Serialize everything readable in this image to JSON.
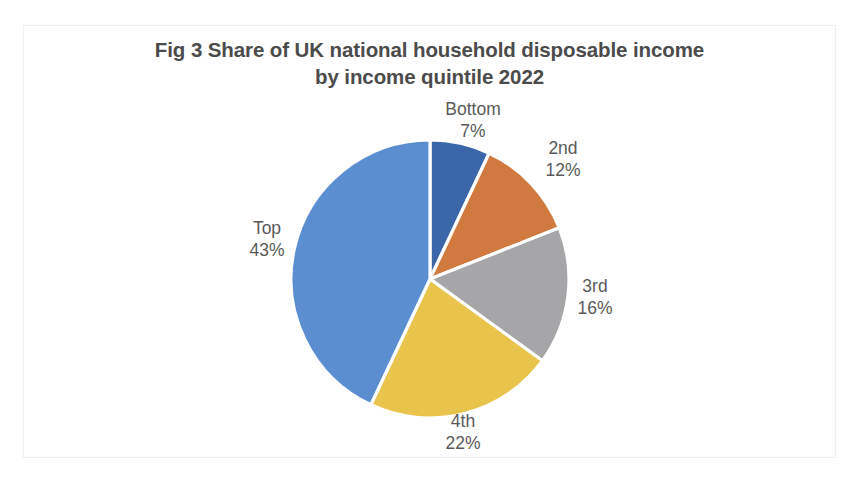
{
  "figure": {
    "title_line1": "Fig 3 Share of UK national household disposable income",
    "title_line2": "by income quintile 2022",
    "title_full": "Fig 3 Share of UK national household disposable income\nby income quintile 2022",
    "title_color": "#4b4b4b",
    "label_color": "#5a5a5a",
    "background_color": "#ffffff",
    "frame_color": "#eef1f3"
  },
  "chart_data": {
    "type": "pie",
    "title": "Fig 3 Share of UK national household disposable income by income quintile 2022",
    "xlabel": "",
    "ylabel": "",
    "legend_position": "none",
    "labels_position": "outside",
    "grid": false,
    "start_angle_deg": 0,
    "direction": "clockwise",
    "unit": "%",
    "categories": [
      "Bottom",
      "2nd",
      "3rd",
      "4th",
      "Top"
    ],
    "values": [
      7,
      12,
      16,
      22,
      43
    ],
    "value_labels": [
      "7%",
      "12%",
      "16%",
      "22%",
      "43%"
    ],
    "colors": [
      "#3c66aa",
      "#d07a3f",
      "#a6a6a9",
      "#e9c44c",
      "#5b8ed1"
    ],
    "slices": [
      {
        "name": "Bottom",
        "value": 7,
        "value_label": "7%",
        "color": "#3c66aa"
      },
      {
        "name": "2nd",
        "value": 12,
        "value_label": "12%",
        "color": "#d07a3f"
      },
      {
        "name": "3rd",
        "value": 16,
        "value_label": "16%",
        "color": "#a6a6a9"
      },
      {
        "name": "4th",
        "value": 22,
        "value_label": "22%",
        "color": "#e9c44c"
      },
      {
        "name": "Top",
        "value": 43,
        "value_label": "43%",
        "color": "#5b8ed1"
      }
    ]
  }
}
